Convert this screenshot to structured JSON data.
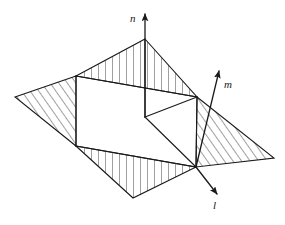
{
  "figure": {
    "background_color": "#ffffff",
    "stroke_color": "#1a1a1a",
    "hatch_color": "#2b2b2b",
    "axes": [
      {
        "id": "n",
        "label": "n",
        "direction": "up",
        "label_x": 130,
        "label_y": 13,
        "origin": [
          196,
          167
        ],
        "tip": [
          145,
          10
        ]
      },
      {
        "id": "m",
        "label": "m",
        "direction": "up-right",
        "label_x": 224,
        "label_y": 79,
        "origin": [
          196,
          167
        ],
        "tip": [
          220,
          68
        ]
      },
      {
        "id": "l",
        "label": "l",
        "direction": "down-right",
        "label_x": 213,
        "label_y": 200,
        "origin": [
          196,
          167
        ],
        "tip": [
          219,
          196
        ]
      }
    ],
    "vertices": {
      "top_apex": [
        145,
        39
      ],
      "left_vertex": [
        15,
        97
      ],
      "right_vertex": [
        274,
        158
      ],
      "bottom_vertex": [
        133,
        198
      ],
      "box_top_left": [
        76,
        76
      ],
      "box_top_right": [
        197,
        97
      ],
      "box_bottom_left": [
        76,
        146
      ],
      "box_bottom_right": [
        197,
        167
      ],
      "box_back_corner": [
        145,
        117
      ],
      "origin": [
        196,
        167
      ]
    },
    "regions": [
      {
        "name": "top-region",
        "hatch": "vertical",
        "polygon": "145,39 197,97 76,76"
      },
      {
        "name": "left-region",
        "hatch": "diagonal",
        "polygon": "15,97 76,76 76,146"
      },
      {
        "name": "right-region",
        "hatch": "diagonal",
        "polygon": "197,97 274,158 196,167"
      },
      {
        "name": "bottom-region",
        "hatch": "vertical",
        "polygon": "76,146 196,167 133,198"
      },
      {
        "name": "center-region",
        "hatch": "none",
        "polygon": "76,76 197,97 196,167 76,146"
      }
    ]
  }
}
